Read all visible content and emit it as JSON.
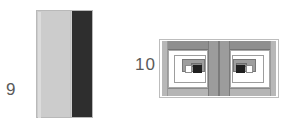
{
  "figures": [
    {
      "label": "9",
      "name": "layered-slab-cross-section",
      "kind": "technical-line-drawing",
      "description": "Rectangular slab cross-section split into a light grey region and a dark nearly-black strip along the right edge.",
      "regions": [
        {
          "name": "light-layer",
          "fill": "#cccccc",
          "width_fraction": 0.62
        },
        {
          "name": "dark-layer",
          "fill": "#2e2e2e",
          "width_fraction": 0.36
        }
      ],
      "outline_color": "#b9b9b9"
    },
    {
      "label": "10",
      "name": "e-core-cross-section",
      "kind": "technical-line-drawing",
      "description": "Symmetric cross-section of an E-shaped magnetic core with two mirrored winding windows separated by a central limb; each window contains nested rectangular winding layers around a small black conductor.",
      "regions": [
        {
          "name": "yoke-top",
          "fill": "#8f8f8f"
        },
        {
          "name": "yoke-bottom",
          "fill": "#b5b5b5"
        },
        {
          "name": "outer-limb",
          "fill": "#b8b8b8"
        },
        {
          "name": "center-limb",
          "fill": "#9c9c9c"
        },
        {
          "name": "window",
          "fill": "#ffffff"
        },
        {
          "name": "winding-layer-1",
          "fill": "#ffffff"
        },
        {
          "name": "winding-layer-2",
          "fill": "#9e9e9e"
        },
        {
          "name": "winding-layer-3",
          "fill": "#8a8a8a"
        },
        {
          "name": "conductor",
          "fill": "#1f1f1f"
        }
      ],
      "outline_color": "#bdbdbd",
      "symmetry": "mirrored-left-right"
    }
  ],
  "background_color": "#ffffff",
  "label_color": "#5a5a5a"
}
